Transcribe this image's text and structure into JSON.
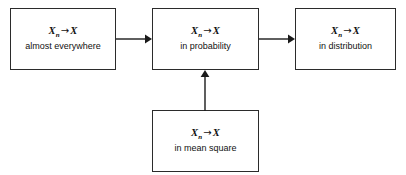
{
  "diagram": {
    "background_color": "#ffffff",
    "line_color": "#2b2b2b",
    "text_color": "#111111",
    "nodes": [
      {
        "id": "almost-everywhere",
        "math_base": "X",
        "math_sub": "n",
        "math_arrow": "→",
        "math_target": "X",
        "label": "almost everywhere"
      },
      {
        "id": "in-probability",
        "math_base": "X",
        "math_sub": "n",
        "math_arrow": "→",
        "math_target": "X",
        "label": "in probability"
      },
      {
        "id": "in-distribution",
        "math_base": "X",
        "math_sub": "n",
        "math_arrow": "→",
        "math_target": "X",
        "label": "in distribution"
      },
      {
        "id": "in-mean-square",
        "math_base": "X",
        "math_sub": "n",
        "math_arrow": "→",
        "math_target": "X",
        "label": "in mean square"
      }
    ],
    "edges": [
      {
        "id": "ae-to-prob",
        "from": "almost-everywhere",
        "to": "in-probability",
        "direction": "right"
      },
      {
        "id": "prob-to-dist",
        "from": "in-probability",
        "to": "in-distribution",
        "direction": "right"
      },
      {
        "id": "ms-to-prob",
        "from": "in-mean-square",
        "to": "in-probability",
        "direction": "up"
      }
    ]
  }
}
